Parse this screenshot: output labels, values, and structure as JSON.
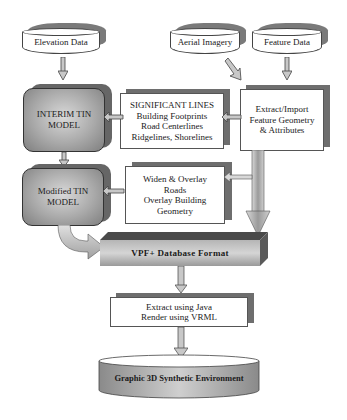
{
  "diagram": {
    "sources": {
      "elevation": "Elevation Data",
      "aerial": "Aerial Imagery",
      "feature": "Feature Data"
    },
    "interim_tin": [
      "INTERIM TIN",
      "MODEL"
    ],
    "significant_lines": [
      "SIGNIFICANT LINES",
      "Building Footprints",
      "Road Centerlines",
      "Ridgelines, Shorelines"
    ],
    "extract_import": [
      "Extract/Import",
      "Feature Geometry",
      "& Attributes"
    ],
    "modified_tin": [
      "Modified TIN",
      "MODEL"
    ],
    "widen_overlay": [
      "Widen & Overlay",
      "Roads",
      "Overlay Building",
      "Geometry"
    ],
    "vpf_database": "VPF+ Database Format",
    "extract_render": [
      "Extract using Java",
      "Render using VRML"
    ],
    "output": "Graphic 3D Synthetic Environment"
  },
  "colors": {
    "shadow": "#6e6e6e",
    "tin_fill": "#a9a9a9",
    "arrow_fill": "#c8c8c8",
    "vpf_top": "#4a4a4a",
    "vpf_front": "#9a9a9a"
  }
}
